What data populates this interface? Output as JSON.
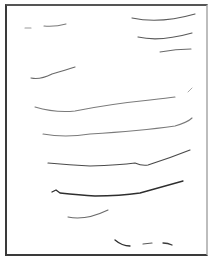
{
  "canvas": {
    "background": "#ffffff",
    "border_color": "#3a3a3a",
    "strokes": [
      {
        "d": "M25,28 L31,28",
        "color": "#9a9a9a",
        "width": 1.1
      },
      {
        "d": "M44,26 Q55,27 66,24",
        "color": "#7a7a7a",
        "width": 1.1
      },
      {
        "d": "M132,18 Q160,24 195,14",
        "color": "#5a5a5a",
        "width": 1.2
      },
      {
        "d": "M138,37 Q160,42 192,33",
        "color": "#5a5a5a",
        "width": 1.2
      },
      {
        "d": "M160,52 Q176,49 191,49",
        "color": "#6a6a6a",
        "width": 1.1
      },
      {
        "d": "M31,78 Q40,80 52,74 Q66,70 75,67",
        "color": "#6a6a6a",
        "width": 1.2
      },
      {
        "d": "M188,92 L192,88",
        "color": "#aaaaaa",
        "width": 1
      },
      {
        "d": "M35,107 Q55,113 75,111 Q110,104 150,100 Q168,98 175,97",
        "color": "#7a7a7a",
        "width": 1.1
      },
      {
        "d": "M43,134 Q65,138 90,134 Q140,131 175,126 Q188,122 192,118",
        "color": "#7a7a7a",
        "width": 1.1
      },
      {
        "d": "M48,163 Q70,165 90,166 Q120,165 135,163 Q142,166 148,165 Q170,158 190,150",
        "color": "#4a4a4a",
        "width": 1.2
      },
      {
        "d": "M52,192 L56,190 L60,193 Q80,195 95,196 Q120,196 140,193 Q165,186 183,181",
        "color": "#2e2e2e",
        "width": 1.3
      },
      {
        "d": "M68,217 Q85,221 108,210",
        "color": "#6a6a6a",
        "width": 1.1
      },
      {
        "d": "M115,240 Q122,246 130,246",
        "color": "#2e2e2e",
        "width": 1.3
      },
      {
        "d": "M143,244 L152,243",
        "color": "#5a5a5a",
        "width": 1.2
      },
      {
        "d": "M163,243 Q168,243 172,245",
        "color": "#3a3a3a",
        "width": 1.3
      }
    ]
  }
}
